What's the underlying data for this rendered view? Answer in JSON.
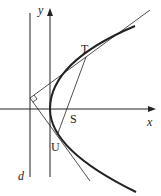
{
  "labels": {
    "y_axis": "y",
    "x_axis": "x",
    "directrix": "d",
    "point_T": "T",
    "point_S": "S",
    "point_U": "U"
  },
  "geometry": {
    "vertex": [
      50,
      109
    ],
    "focus_S": [
      69,
      109
    ],
    "point_T": [
      86,
      57
    ],
    "point_U": [
      57,
      132
    ],
    "directrix_x": 30,
    "tangent_meet": [
      30,
      98
    ]
  },
  "colors": {
    "stroke": "#222222",
    "background": "#ffffff"
  }
}
